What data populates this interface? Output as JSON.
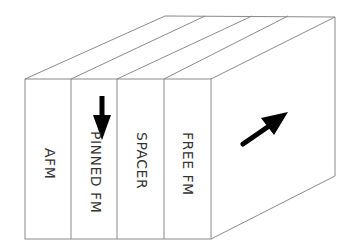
{
  "diagram": {
    "title": "",
    "layers": [
      {
        "label": "AFM",
        "magnetization": "none"
      },
      {
        "label": "PINNED FM",
        "magnetization": "down"
      },
      {
        "label": "SPACER",
        "magnetization": "none"
      },
      {
        "label": "FREE FM",
        "magnetization": "none"
      }
    ],
    "side_face": {
      "magnetization": "diagonal-up-right"
    },
    "colors": {
      "line": "#8a8a8a",
      "arrow": "#000000",
      "text": "#333333",
      "background": "#ffffff"
    }
  }
}
